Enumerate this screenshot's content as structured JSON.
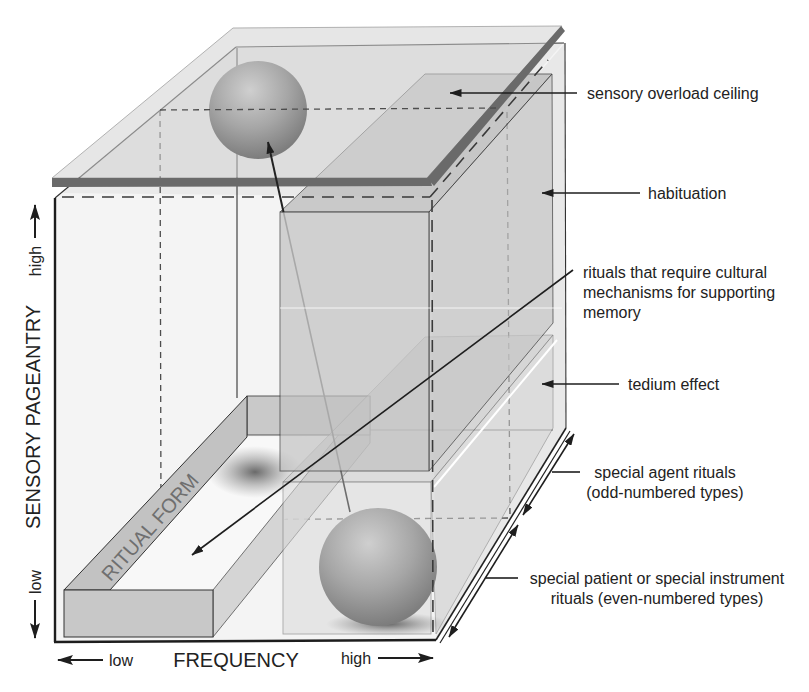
{
  "figure": {
    "colors": {
      "background": "#ffffff",
      "box_interior": "#f4f4f4",
      "box_right_face": "#e8e8e8",
      "ceiling_edge": "#6a6a6a",
      "ceiling_top": "#d3d3d3",
      "column_front": "#c2c2c2",
      "column_top": "#b9b9b9",
      "column_side": "#c7c7c7",
      "tedium_front": "#dadada",
      "ritual_form_front": "#c8c8c8",
      "ritual_form_strip": "#c2c2c2",
      "ritual_label": "#6f6f6f",
      "text": "#222222"
    },
    "axes": {
      "y": {
        "label": "SENSORY PAGEANTRY",
        "high": "high",
        "low": "low"
      },
      "x": {
        "label": "FREQUENCY",
        "low": "low",
        "high": "high"
      }
    },
    "ritual_form": {
      "label": "RITUAL FORM"
    },
    "annotations": {
      "sensory_overload_ceiling": [
        "sensory overload ceiling"
      ],
      "habituation": [
        "habituation"
      ],
      "cultural_memory": [
        "rituals that require cultural",
        "mechanisms for supporting",
        "memory"
      ],
      "tedium_effect": [
        "tedium effect"
      ],
      "special_agent": [
        "special agent rituals",
        "(odd-numbered types)"
      ],
      "special_patient": [
        "special patient or special instrument",
        "rituals (even-numbered types)"
      ]
    }
  }
}
